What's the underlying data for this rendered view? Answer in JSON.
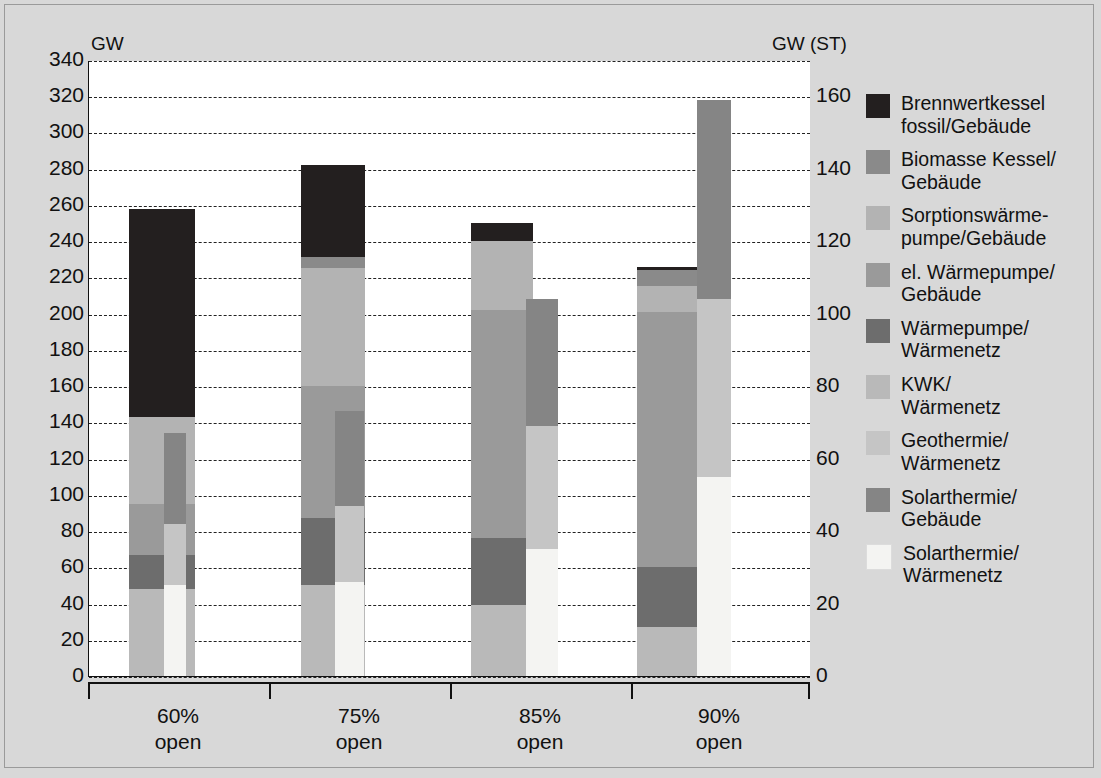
{
  "axes": {
    "left_caption": "GW",
    "right_caption": "GW (ST)",
    "left_ticks": [
      "340",
      "320",
      "300",
      "280",
      "260",
      "240",
      "220",
      "200",
      "180",
      "160",
      "140",
      "120",
      "100",
      "80",
      "60",
      "40",
      "20",
      "0"
    ],
    "right_ticks": [
      "160",
      "140",
      "120",
      "100",
      "80",
      "60",
      "40",
      "20",
      "0"
    ]
  },
  "legend": {
    "items": [
      {
        "label": "Brennwertkessel\nfossil/Gebäude",
        "color": "#231f1f"
      },
      {
        "label": "Biomasse Kessel/\nGebäude",
        "color": "#8a8a8a"
      },
      {
        "label": "Sorptionswärme-\npumpe/Gebäude",
        "color": "#b3b3b3"
      },
      {
        "label": "el. Wärmepumpe/\nGebäude",
        "color": "#9a9a9a"
      },
      {
        "label": "Wärmepumpe/\nWärmenetz",
        "color": "#6d6d6d"
      },
      {
        "label": "KWK/\nWärmenetz",
        "color": "#b9b9b9"
      },
      {
        "label": "Geothermie/\nWärmenetz",
        "color": "#c5c5c5"
      },
      {
        "label": "Solarthermie/\nGebäude",
        "color": "#858585"
      },
      {
        "label": "Solarthermie/\nWärmenetz",
        "color": "#f4f4f2"
      }
    ]
  },
  "chart_data": {
    "type": "bar",
    "title": "",
    "xlabel": "",
    "ylabel": "GW",
    "ylabel_secondary": "GW (ST)",
    "ylim": [
      0,
      340
    ],
    "ylim_secondary": [
      0,
      170
    ],
    "ytick_step": 20,
    "ytick_step_secondary": 20,
    "grid": true,
    "legend_position": "right",
    "categories": [
      "60%\nopen",
      "75%\nopen",
      "85%\nopen",
      "90%\nopen"
    ],
    "note": "Each category has a wide main bar (left axis, GW) and a narrow overlaid bar (right axis, GW solar thermal).",
    "series": [
      {
        "name": "Solarthermie/Wärmenetz",
        "color": "#f4f4f2",
        "axis": "right",
        "bar": "narrow",
        "values": [
          25,
          26,
          35,
          55
        ]
      },
      {
        "name": "Geothermie/Wärmenetz",
        "color": "#c5c5c5",
        "axis": "right",
        "bar": "narrow",
        "values": [
          42,
          47,
          69,
          104
        ]
      },
      {
        "name": "Solarthermie/Gebäude",
        "color": "#858585",
        "axis": "right",
        "bar": "narrow",
        "values": [
          67,
          73,
          104,
          159
        ]
      },
      {
        "name": "KWK/Wärmenetz",
        "color": "#b9b9b9",
        "axis": "left",
        "bar": "wide",
        "values": [
          48,
          50,
          39,
          27
        ]
      },
      {
        "name": "Wärmepumpe/Wärmenetz",
        "color": "#6d6d6d",
        "axis": "left",
        "bar": "wide",
        "values": [
          67,
          87,
          76,
          60
        ]
      },
      {
        "name": "el. Wärmepumpe/Gebäude",
        "color": "#9a9a9a",
        "axis": "left",
        "bar": "wide",
        "values": [
          95,
          160,
          202,
          201
        ]
      },
      {
        "name": "Sorptionswärmepumpe/Gebäude",
        "color": "#b3b3b3",
        "axis": "left",
        "bar": "wide",
        "values": [
          143,
          225,
          240,
          215
        ]
      },
      {
        "name": "Biomasse Kessel/Gebäude",
        "color": "#8a8a8a",
        "axis": "left",
        "bar": "wide",
        "values": [
          143,
          231,
          240,
          224
        ]
      },
      {
        "name": "Brennwertkessel fossil/Gebäude",
        "color": "#231f1f",
        "axis": "left",
        "bar": "wide",
        "values": [
          258,
          282,
          250,
          226
        ]
      }
    ],
    "cumulative_tops_wide": {
      "60%": {
        "KWK/Wärmenetz": 48,
        "Wärmepumpe/Wärmenetz": 67,
        "el. Wärmepumpe/Gebäude": 95,
        "Sorptionswärmepumpe/Gebäude": 143,
        "Biomasse Kessel/Gebäude": 143,
        "Brennwertkessel fossil/Gebäude": 258
      },
      "75%": {
        "KWK/Wärmenetz": 50,
        "Wärmepumpe/Wärmenetz": 87,
        "el. Wärmepumpe/Gebäude": 160,
        "Sorptionswärmepumpe/Gebäude": 225,
        "Biomasse Kessel/Gebäude": 231,
        "Brennwertkessel fossil/Gebäude": 282
      },
      "85%": {
        "KWK/Wärmenetz": 39,
        "Wärmepumpe/Wärmenetz": 76,
        "el. Wärmepumpe/Gebäude": 202,
        "Sorptionswärmepumpe/Gebäude": 240,
        "Biomasse Kessel/Gebäude": 240,
        "Brennwertkessel fossil/Gebäude": 250
      },
      "90%": {
        "KWK/Wärmenetz": 27,
        "Wärmepumpe/Wärmenetz": 60,
        "el. Wärmepumpe/Gebäude": 201,
        "Sorptionswärmepumpe/Gebäude": 215,
        "Biomasse Kessel/Gebäude": 224,
        "Brennwertkessel fossil/Gebäude": 226
      }
    },
    "cumulative_tops_narrow_right_axis": {
      "60%": {
        "Solarthermie/Wärmenetz": 25,
        "Geothermie/Wärmenetz": 42,
        "Solarthermie/Gebäude": 67
      },
      "75%": {
        "Solarthermie/Wärmenetz": 26,
        "Geothermie/Wärmenetz": 47,
        "Solarthermie/Gebäude": 73
      },
      "85%": {
        "Solarthermie/Wärmenetz": 35,
        "Geothermie/Wärmenetz": 69,
        "Solarthermie/Gebäude": 104
      },
      "90%": {
        "Solarthermie/Wärmenetz": 55,
        "Geothermie/Wärmenetz": 104,
        "Solarthermie/Gebäude": 159
      }
    }
  }
}
